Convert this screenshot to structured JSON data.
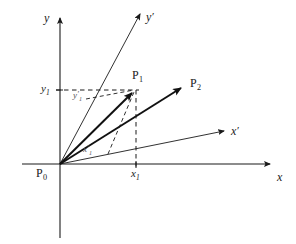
{
  "figure": {
    "type": "geometry-diagram",
    "background_color": "#ffffff",
    "line_color": "#1a1a1a",
    "vector_color": "#111111"
  },
  "axes": {
    "x": {
      "label": "x",
      "label_x": 277,
      "label_y": 172
    },
    "y": {
      "label": "y",
      "label_x": 44,
      "label_y": 12
    },
    "x_prime": {
      "label": "x",
      "prime": "′",
      "label_x": 231,
      "label_y": 126
    },
    "y_prime": {
      "label": "y",
      "prime": "′",
      "label_x": 146,
      "label_y": 12
    }
  },
  "points": [
    {
      "name": "P",
      "sub": "0",
      "label_x": 36,
      "label_y": 168,
      "role": "origin"
    },
    {
      "name": "P",
      "sub": "1",
      "label_x": 132,
      "label_y": 70,
      "role": "point"
    },
    {
      "name": "P",
      "sub": "2",
      "label_x": 190,
      "label_y": 78,
      "role": "point"
    }
  ],
  "tick_labels": [
    {
      "text": "y",
      "sub": "1",
      "prime": "",
      "x": 44,
      "y": 73,
      "axis": "y"
    },
    {
      "text": "x",
      "sub": "1",
      "prime": "",
      "x": 126,
      "y": 167,
      "axis": "x"
    },
    {
      "text": "y",
      "sub": "1",
      "prime": "′",
      "x": 74,
      "y": 90,
      "axis": "y-prime"
    },
    {
      "text": "x",
      "sub": "1",
      "prime": "′",
      "x": 84,
      "y": 145,
      "axis": "x-prime"
    }
  ],
  "geometry": {
    "origin": {
      "x": 60,
      "y": 164
    },
    "x_axis_end": {
      "x": 274,
      "y": 164
    },
    "y_axis_top": {
      "x": 60,
      "y": 14
    },
    "y_axis_bottom": {
      "x": 60,
      "y": 238
    },
    "x_prime_end": {
      "x": 228,
      "y": 129
    },
    "y_prime_end": {
      "x": 141,
      "y": 10
    },
    "P1": {
      "x": 136,
      "y": 90
    },
    "P2": {
      "x": 186,
      "y": 85
    },
    "y1_tick_y": 90,
    "x1_tick_x": 136
  },
  "legend": {
    "caption": ""
  }
}
